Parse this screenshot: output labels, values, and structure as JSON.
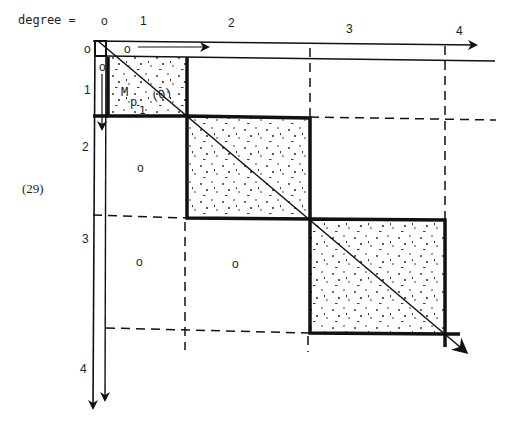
{
  "header": {
    "degree_label": "degree =",
    "column_degrees": [
      "o",
      "1",
      "2",
      "3",
      "4"
    ]
  },
  "row_degrees": [
    "o",
    "1",
    "2",
    "3",
    "4"
  ],
  "equation_number": "(29)",
  "blocks": [
    {
      "label": "M",
      "sub": "p",
      "subsub": "1",
      "suffix": "(0)"
    }
  ],
  "zero_marks": {
    "top_row_zero": "o",
    "left_col_zero": "o",
    "block_2_1": "o",
    "block_3_1": "o",
    "block_3_2": "o"
  },
  "colors": {
    "ink": "#111111",
    "background": "#ffffff"
  }
}
